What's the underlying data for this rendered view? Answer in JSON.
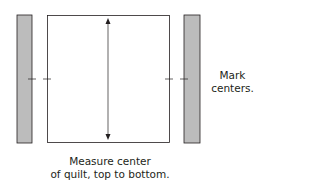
{
  "diagram": {
    "labels": {
      "mark_line1": "Mark",
      "mark_line2": "centers.",
      "measure_line1": "Measure center",
      "measure_line2": "of quilt, top to bottom."
    },
    "colors": {
      "strip_fill": "#bcbcbc",
      "stroke": "#231f20",
      "quilt_fill": "#ffffff"
    }
  }
}
